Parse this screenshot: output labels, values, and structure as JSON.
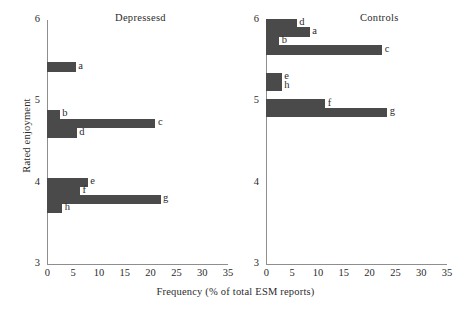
{
  "chart_data": {
    "type": "bar",
    "orientation": "horizontal",
    "title": "",
    "xlabel": "Frequency (% of total ESM reports)",
    "ylabel": "Rated enjoyment",
    "xlim": [
      0,
      35
    ],
    "ylim": [
      3,
      6
    ],
    "xticks": [
      0,
      5,
      10,
      15,
      20,
      25,
      30,
      35
    ],
    "yticks": [
      3,
      4,
      5,
      6
    ],
    "grid": false,
    "legend": false,
    "panels": [
      {
        "name": "depressed",
        "title": "Depressesd",
        "categories": [
          "a",
          "b",
          "c",
          "d",
          "e",
          "f",
          "g",
          "h"
        ],
        "y_positions": [
          5.42,
          4.84,
          4.73,
          4.61,
          4.0,
          3.9,
          3.79,
          3.68
        ],
        "values": [
          5.6,
          2.5,
          21.0,
          5.8,
          7.9,
          6.4,
          22.0,
          3.0
        ]
      },
      {
        "name": "controls",
        "title": "Controls",
        "categories": [
          "d",
          "a",
          "b",
          "c",
          "e",
          "h",
          "f",
          "g"
        ],
        "y_positions": [
          5.96,
          5.85,
          5.74,
          5.63,
          5.29,
          5.18,
          4.97,
          4.86
        ],
        "values": [
          6.0,
          8.5,
          2.6,
          22.5,
          3.1,
          3.1,
          11.5,
          23.5
        ]
      }
    ]
  },
  "colors": {
    "bar": "#4a4a4a",
    "axis": "#8e8e8e",
    "text": "#2b2b2b",
    "background": "#ffffff"
  }
}
